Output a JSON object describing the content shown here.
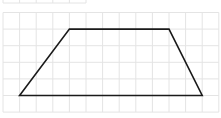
{
  "figure": {
    "shape": "trapezoid",
    "stroke_color": "#1a1a1a",
    "grid_color": "#e4e4e4",
    "background": "#ffffff",
    "grid": {
      "cell_size": 16.6,
      "columns": 13,
      "rows": 6,
      "origin_x": 3,
      "origin_y": 12.5
    },
    "top_partial_grid": {
      "columns": 5,
      "height": 3
    },
    "vertices_grid_units": [
      {
        "label": "bottom-left",
        "col": 1,
        "row": 5
      },
      {
        "label": "top-left",
        "col": 4,
        "row": 1
      },
      {
        "label": "top-right",
        "col": 10,
        "row": 1
      },
      {
        "label": "bottom-right",
        "col": 12,
        "row": 5
      }
    ],
    "top_base_units": 6,
    "bottom_base_units": 11,
    "height_units": 4
  }
}
